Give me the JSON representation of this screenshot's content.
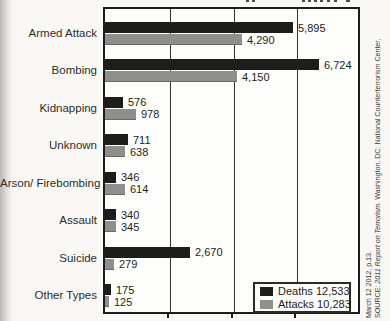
{
  "figure": {
    "background": "#f9f8f5",
    "frame_color": "#1c1c1c"
  },
  "chart_data": {
    "type": "bar",
    "orientation": "horizontal",
    "categories": [
      "Armed Attack",
      "Bombing",
      "Kidnapping",
      "Unknown",
      "Arson/ Firebombing",
      "Assault",
      "Suicide",
      "Other Types"
    ],
    "series": [
      {
        "name": "Deaths",
        "color": "#1d1d1b",
        "values": [
          5895,
          6724,
          576,
          711,
          346,
          340,
          2670,
          175
        ],
        "value_labels": [
          "5,895",
          "6,724",
          "576",
          "711",
          "346",
          "340",
          "2,670",
          "175"
        ]
      },
      {
        "name": "Attacks",
        "color": "#8f8f8d",
        "values": [
          4290,
          4150,
          978,
          638,
          614,
          345,
          279,
          125
        ],
        "value_labels": [
          "4,290",
          "4,150",
          "978",
          "638",
          "614",
          "345",
          "279",
          "125"
        ]
      }
    ],
    "xlim": [
      0,
      8000
    ],
    "gridline_values": [
      2000,
      4000,
      6000
    ],
    "grid": true,
    "legend_position": "bottom-right"
  },
  "legend": {
    "entries": [
      {
        "series": "Deaths",
        "label": "Deaths 12,533",
        "color": "#1d1d1b"
      },
      {
        "series": "Attacks",
        "label": "Attacks 10,283",
        "color": "#8f8f8d"
      }
    ]
  },
  "source_note": {
    "prefix": "SOURCE: ",
    "title_italic": "2011 Report on Terrorism.",
    "rest": " Washington, DC: National Counterterrorism Center,",
    "line2": "March 12  2012, p.13."
  }
}
